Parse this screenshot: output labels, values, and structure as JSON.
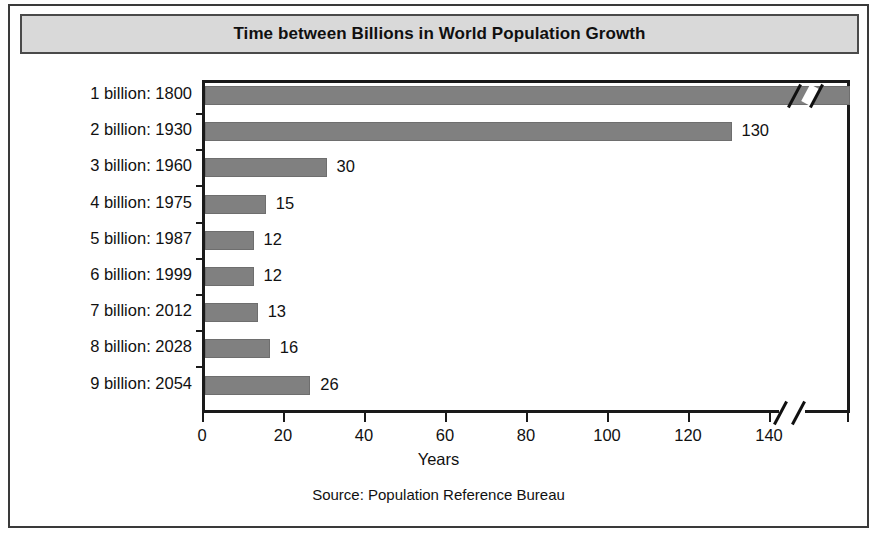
{
  "figure": {
    "title": "Time between Billions in World Population Growth",
    "source": "Source: Population Reference Bureau",
    "bar_color": "#808080",
    "title_background": "#d9d9d9",
    "frame_color": "#3a3a3a"
  },
  "chart_data": {
    "type": "bar",
    "orientation": "horizontal",
    "title": "Time between Billions in World Population Growth",
    "xlabel": "Years",
    "ylabel": "",
    "source": "Source: Population Reference Bureau",
    "grid": false,
    "legend": false,
    "xlim": [
      0,
      160
    ],
    "xticks": [
      0,
      20,
      40,
      60,
      80,
      100,
      120,
      140
    ],
    "xtick_labels": [
      "0",
      "20",
      "40",
      "60",
      "80",
      "100",
      "120",
      "140"
    ],
    "axis_break": {
      "present": true,
      "after_value": 140,
      "note": "Axis and first bar are broken; first bar extends beyond the plotted scale."
    },
    "categories": [
      "1 billion: 1800",
      "2 billion: 1930",
      "3 billion: 1960",
      "4 billion: 1975",
      "5 billion: 1987",
      "6 billion: 1999",
      "7 billion: 2012",
      "8 billion: 2028",
      "9 billion: 2054"
    ],
    "values": [
      null,
      130,
      30,
      15,
      12,
      12,
      13,
      16,
      26
    ],
    "value_labels": [
      "",
      "130",
      "30",
      "15",
      "12",
      "12",
      "13",
      "16",
      "26"
    ],
    "bars": [
      {
        "category": "1 billion: 1800",
        "milestone": "1 billion",
        "year": 1800,
        "value": null,
        "label": "",
        "broken": true
      },
      {
        "category": "2 billion: 1930",
        "milestone": "2 billion",
        "year": 1930,
        "value": 130,
        "label": "130",
        "broken": false
      },
      {
        "category": "3 billion: 1960",
        "milestone": "3 billion",
        "year": 1960,
        "value": 30,
        "label": "30",
        "broken": false
      },
      {
        "category": "4 billion: 1975",
        "milestone": "4 billion",
        "year": 1975,
        "value": 15,
        "label": "15",
        "broken": false
      },
      {
        "category": "5 billion: 1987",
        "milestone": "5 billion",
        "year": 1987,
        "value": 12,
        "label": "12",
        "broken": false
      },
      {
        "category": "6 billion: 1999",
        "milestone": "6 billion",
        "year": 1999,
        "value": 12,
        "label": "12",
        "broken": false
      },
      {
        "category": "7 billion: 2012",
        "milestone": "7 billion",
        "year": 2012,
        "value": 13,
        "label": "13",
        "broken": false
      },
      {
        "category": "8 billion: 2028",
        "milestone": "8 billion",
        "year": 2028,
        "value": 16,
        "label": "16",
        "broken": false
      },
      {
        "category": "9 billion: 2054",
        "milestone": "9 billion",
        "year": 2054,
        "value": 26,
        "label": "26",
        "broken": false
      }
    ]
  }
}
